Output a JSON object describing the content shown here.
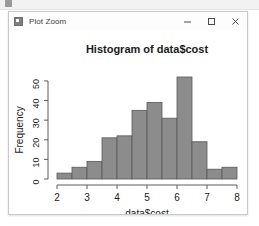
{
  "window": {
    "title": "Plot Zoom",
    "icon": "plot-window-icon",
    "controls": [
      {
        "name": "minimize-button",
        "glyph": "minimize-icon"
      },
      {
        "name": "maximize-button",
        "glyph": "maximize-icon"
      },
      {
        "name": "close-button",
        "glyph": "close-icon"
      }
    ]
  },
  "colors": {
    "bar_fill": "#8c8c8c",
    "bar_border": "#595959",
    "axis": "#4d4d4d",
    "text": "#1a1a1a",
    "window_bg": "#ffffff",
    "titlebar_bg": "#fdfdfd"
  },
  "chart_data": {
    "type": "bar",
    "title": "Histogram of data$cost",
    "xlabel": "data$cost",
    "ylabel": "Frequency",
    "xlim": [
      2,
      8
    ],
    "ylim": [
      0,
      52
    ],
    "bin_width": 0.5,
    "xticks": [
      2,
      3,
      4,
      5,
      6,
      7,
      8
    ],
    "yticks": [
      0,
      10,
      20,
      30,
      40,
      50
    ],
    "grid": false,
    "legend": null,
    "bin_edges": [
      2.0,
      2.5,
      3.0,
      3.5,
      4.0,
      4.5,
      5.0,
      5.5,
      6.0,
      6.5,
      7.0,
      7.5,
      8.0
    ],
    "categories": [
      "2.0-2.5",
      "2.5-3.0",
      "3.0-3.5",
      "3.5-4.0",
      "4.0-4.5",
      "4.5-5.0",
      "5.0-5.5",
      "5.5-6.0",
      "6.0-6.5",
      "6.5-7.0",
      "7.0-7.5",
      "7.5-8.0"
    ],
    "values": [
      3,
      6,
      9,
      21,
      22,
      35,
      39,
      31,
      52,
      19,
      5,
      6
    ]
  }
}
